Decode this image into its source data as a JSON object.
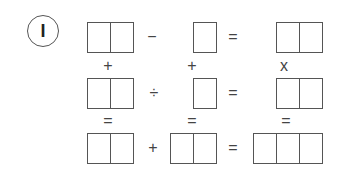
{
  "puzzle": {
    "number_label": "I",
    "rows": [
      {
        "boxes": [
          {
            "cells": 2,
            "x": 87,
            "w": 47
          },
          {
            "cells": 1,
            "x": 193,
            "w": 24
          },
          {
            "cells": 2,
            "x": 276,
            "w": 47
          }
        ],
        "y": 22,
        "ops": [
          {
            "symbol": "−",
            "x": 152
          },
          {
            "symbol": "=",
            "x": 233
          }
        ]
      },
      {
        "boxes": [
          {
            "cells": 2,
            "x": 87,
            "w": 47
          },
          {
            "cells": 1,
            "x": 193,
            "w": 24
          },
          {
            "cells": 2,
            "x": 276,
            "w": 47
          }
        ],
        "y": 78,
        "ops": [
          {
            "symbol": "÷",
            "x": 154
          },
          {
            "symbol": "=",
            "x": 233
          }
        ]
      },
      {
        "boxes": [
          {
            "cells": 2,
            "x": 87,
            "w": 47
          },
          {
            "cells": 2,
            "x": 170,
            "w": 47
          },
          {
            "cells": 3,
            "x": 253,
            "w": 70
          }
        ],
        "y": 133,
        "ops": [
          {
            "symbol": "+",
            "x": 153
          },
          {
            "symbol": "=",
            "x": 233
          }
        ]
      }
    ],
    "vertical_ops": [
      {
        "symbols": [
          "+",
          "+",
          "x"
        ],
        "y": 66,
        "xs": [
          108,
          192,
          284
        ]
      },
      {
        "symbols": [
          "=",
          "=",
          "="
        ],
        "y": 121,
        "xs": [
          108,
          192,
          286
        ]
      }
    ]
  }
}
